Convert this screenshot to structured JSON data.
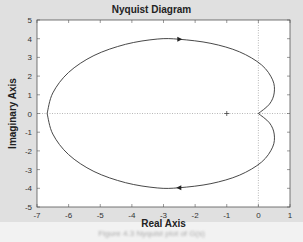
{
  "chart_data": {
    "type": "line",
    "title": "Nyquist Diagram",
    "xlabel": "Real Axis",
    "ylabel": "Imaginary Axis",
    "xlim": [
      -7,
      1
    ],
    "ylim": [
      -5,
      5
    ],
    "xticks": [
      -7,
      -6,
      -5,
      -4,
      -3,
      -2,
      -1,
      0,
      1
    ],
    "yticks": [
      -5,
      -4,
      -3,
      -2,
      -1,
      0,
      1,
      2,
      3,
      4,
      5
    ],
    "grid": false,
    "critical_point": [
      -1,
      0
    ],
    "series": [
      {
        "name": "Nyquist (positive freq)",
        "points": [
          [
            0,
            0
          ],
          [
            0.35,
            0.5
          ],
          [
            0.5,
            1.1
          ],
          [
            0.45,
            1.8
          ],
          [
            0.1,
            2.6
          ],
          [
            -0.6,
            3.3
          ],
          [
            -1.5,
            3.75
          ],
          [
            -2.5,
            3.97
          ],
          [
            -3.2,
            3.98
          ],
          [
            -4.2,
            3.7
          ],
          [
            -5.2,
            3.1
          ],
          [
            -6.0,
            2.2
          ],
          [
            -6.5,
            1.1
          ],
          [
            -6.68,
            0
          ]
        ],
        "arrow_at": [
          -2.5,
          3.97
        ],
        "arrow_direction": "right"
      },
      {
        "name": "Nyquist (negative freq)",
        "points": [
          [
            -6.68,
            0
          ],
          [
            -6.5,
            -1.1
          ],
          [
            -6.0,
            -2.2
          ],
          [
            -5.2,
            -3.1
          ],
          [
            -4.2,
            -3.7
          ],
          [
            -3.2,
            -3.98
          ],
          [
            -2.5,
            -3.97
          ],
          [
            -1.5,
            -3.75
          ],
          [
            -0.6,
            -3.3
          ],
          [
            0.1,
            -2.6
          ],
          [
            0.45,
            -1.8
          ],
          [
            0.5,
            -1.1
          ],
          [
            0.35,
            -0.5
          ],
          [
            0,
            0
          ]
        ],
        "arrow_at": [
          -2.5,
          -3.97
        ],
        "arrow_direction": "left"
      }
    ]
  },
  "figure": {
    "caption": "Figure 4.3  Nyquist plot of G(s)"
  }
}
